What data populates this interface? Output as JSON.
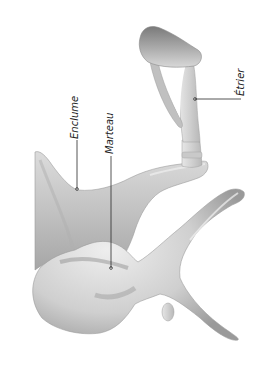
{
  "figure": {
    "orientation": "rotated 90° counterclockwise",
    "colors": {
      "background": "#ffffff",
      "bone_light": "#ececec",
      "bone_mid": "#c4c4c4",
      "bone_dark": "#8a8a8a",
      "leader_line": "#2a2a2a"
    }
  },
  "labels": {
    "enclume": "Enclume",
    "marteau": "Marteau",
    "etrier": "Étrier"
  }
}
